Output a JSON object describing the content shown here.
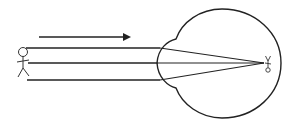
{
  "diagram": {
    "stroke_color": "#222222",
    "background": "#ffffff",
    "direction_arrow": {
      "x1": 39,
      "y1": 37,
      "x2": 135,
      "y2": 37
    },
    "object": {
      "label": "stick-figure-object",
      "head_cx": 23,
      "head_cy": 52,
      "head_r": 4.5
    },
    "rays": [
      {
        "name": "top-ray",
        "x_start": 26,
        "y": 48,
        "x_cornea": 160
      },
      {
        "name": "middle-ray",
        "x_start": 28,
        "y": 63,
        "x_cornea": 158
      },
      {
        "name": "bottom-ray",
        "x_start": 27,
        "y": 80,
        "x_cornea": 160
      }
    ],
    "focal_point": {
      "x": 264,
      "y": 63
    },
    "image": {
      "label": "inverted-image",
      "x": 268,
      "y": 63
    },
    "eye": {
      "label": "eyeball-outline"
    }
  }
}
